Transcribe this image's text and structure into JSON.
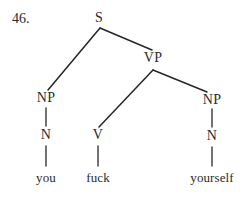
{
  "figure": {
    "item_number": "46.",
    "kind": "syntax-tree",
    "sentence": "you fuck yourself",
    "colors": {
      "background": "#ffffff",
      "ink": "#2b2b2b",
      "branch": "#262626"
    },
    "nodes": [
      {
        "id": "s",
        "label": "S",
        "x": 99,
        "y": 18,
        "type": "category"
      },
      {
        "id": "vp",
        "label": "VP",
        "x": 153,
        "y": 58,
        "type": "category"
      },
      {
        "id": "np_subj",
        "label": "NP",
        "x": 46,
        "y": 98,
        "type": "category"
      },
      {
        "id": "np_obj",
        "label": "NP",
        "x": 212,
        "y": 100,
        "type": "category"
      },
      {
        "id": "n_subj",
        "label": "N",
        "x": 46,
        "y": 135,
        "type": "category"
      },
      {
        "id": "v",
        "label": "V",
        "x": 98,
        "y": 135,
        "type": "category"
      },
      {
        "id": "n_obj",
        "label": "N",
        "x": 212,
        "y": 136,
        "type": "category"
      },
      {
        "id": "you",
        "label": "you",
        "x": 46,
        "y": 177,
        "type": "leaf"
      },
      {
        "id": "fuck",
        "label": "fuck",
        "x": 98,
        "y": 177,
        "type": "leaf"
      },
      {
        "id": "yourself",
        "label": "yourself",
        "x": 212,
        "y": 177,
        "type": "leaf"
      }
    ],
    "branches": [
      {
        "from": "s",
        "to": "np_subj",
        "x1": 100,
        "y1": 28,
        "x2": 48,
        "y2": 90
      },
      {
        "from": "s",
        "to": "vp",
        "x1": 100,
        "y1": 28,
        "x2": 152,
        "y2": 50
      },
      {
        "from": "vp",
        "to": "v",
        "x1": 153,
        "y1": 70,
        "x2": 99,
        "y2": 127
      },
      {
        "from": "vp",
        "to": "np_obj",
        "x1": 153,
        "y1": 70,
        "x2": 207,
        "y2": 92
      },
      {
        "from": "np_subj",
        "to": "n_subj",
        "x1": 46,
        "y1": 108,
        "x2": 46,
        "y2": 126
      },
      {
        "from": "np_obj",
        "to": "n_obj",
        "x1": 212,
        "y1": 109,
        "x2": 212,
        "y2": 127
      },
      {
        "from": "n_subj",
        "to": "you",
        "x1": 46,
        "y1": 146,
        "x2": 46,
        "y2": 166
      },
      {
        "from": "v",
        "to": "fuck",
        "x1": 98,
        "y1": 146,
        "x2": 98,
        "y2": 166
      },
      {
        "from": "n_obj",
        "to": "yourself",
        "x1": 212,
        "y1": 147,
        "x2": 212,
        "y2": 166
      }
    ]
  }
}
